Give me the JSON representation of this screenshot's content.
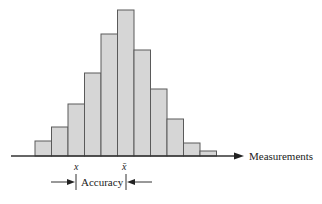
{
  "chart_data": {
    "type": "bar",
    "title": "",
    "xlabel": "Measurements",
    "ylabel": "",
    "categories": [
      "1",
      "2",
      "3",
      "4",
      "5",
      "6",
      "7",
      "8",
      "9",
      "10",
      "11"
    ],
    "values": [
      15,
      29,
      52,
      83,
      122,
      146,
      106,
      67,
      37,
      13,
      5
    ],
    "ylim": [
      0,
      150
    ],
    "grid": false,
    "legend": null,
    "annotations": [
      {
        "text": "x",
        "position": "below axis under 3rd/4th bar boundary",
        "meaning": "measured value"
      },
      {
        "text": "x̄",
        "position": "below axis under tallest bar",
        "meaning": "mean"
      },
      {
        "text": "Accuracy",
        "position": "between x and x̄ with inward arrows"
      }
    ]
  },
  "labels": {
    "axis": "Measurements",
    "x": "x",
    "xbar": "x̄",
    "accuracy": "Accuracy"
  },
  "colors": {
    "bar_fill": "#d6d6d6",
    "bar_stroke": "#5a5a5a",
    "axis": "#333333"
  }
}
